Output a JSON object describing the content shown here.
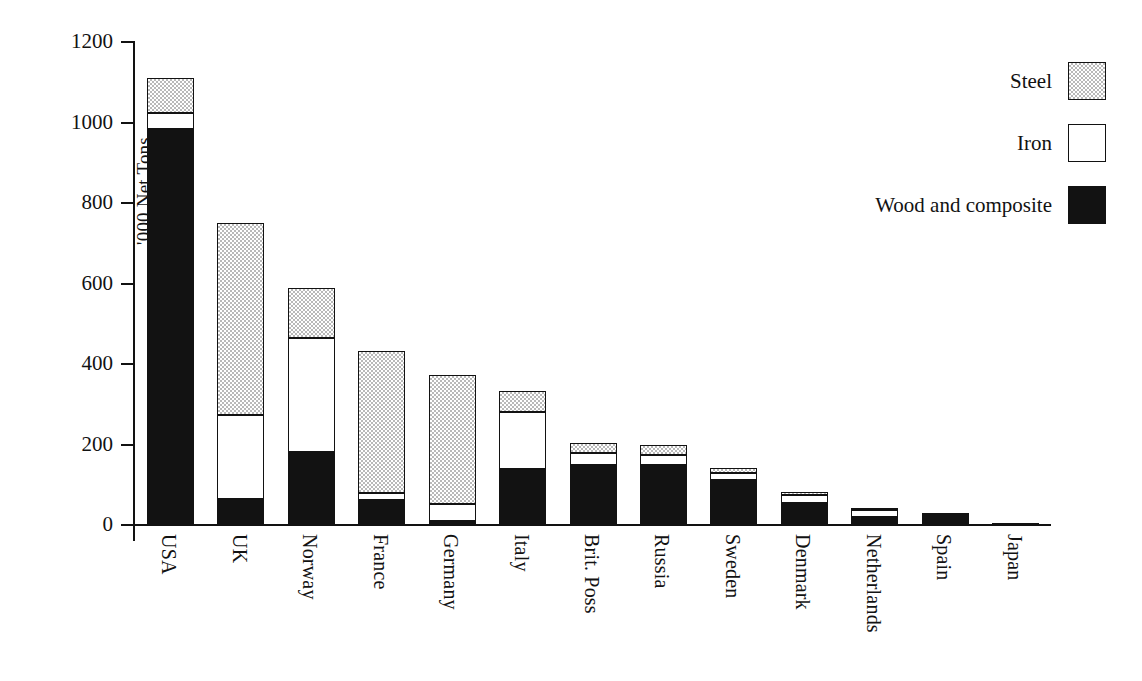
{
  "chart_data": {
    "type": "bar",
    "subtype": "stacked-bar",
    "title": "",
    "xlabel": "",
    "ylabel": "'000 Net Tons",
    "ylim": [
      0,
      1200
    ],
    "ytick_step": 200,
    "yticks": [
      0,
      200,
      400,
      600,
      800,
      1000,
      1200
    ],
    "ytick_labels": [
      "0",
      "200",
      "400",
      "600",
      "800",
      "1000",
      "1200"
    ],
    "grid": false,
    "legend_position": "top-right",
    "categories": [
      "USA",
      "UK",
      "Norway",
      "France",
      "Germany",
      "Italy",
      "Brit. Poss",
      "Russia",
      "Sweden",
      "Denmark",
      "Netherlands",
      "Spain",
      "Japan"
    ],
    "series": [
      {
        "name": "Wood and composite",
        "color": "#121212",
        "values": [
          985,
          65,
          181,
          62,
          10,
          140,
          150,
          148,
          112,
          55,
          20,
          30,
          5
        ]
      },
      {
        "name": "Iron",
        "color": "#ffffff",
        "values": [
          38,
          208,
          284,
          18,
          42,
          140,
          30,
          26,
          17,
          20,
          17,
          0,
          0
        ]
      },
      {
        "name": "Steel",
        "color": "#b9b9b9",
        "values": [
          88,
          478,
          124,
          353,
          320,
          53,
          25,
          24,
          13,
          8,
          6,
          0,
          0
        ]
      }
    ],
    "totals": [
      1111,
      751,
      589,
      433,
      372,
      333,
      205,
      198,
      142,
      83,
      43,
      30,
      5
    ]
  },
  "axis": {
    "y_label": "'000 Net Tons",
    "y_ticks": [
      "1200",
      "1000",
      "800",
      "600",
      "400",
      "200",
      "0"
    ]
  },
  "legend": {
    "items": [
      {
        "label": "Steel",
        "swatch": "steel-pattern-swatch"
      },
      {
        "label": "Iron",
        "swatch": "iron-white-swatch"
      },
      {
        "label": "Wood and composite",
        "swatch": "wood-black-swatch"
      }
    ]
  }
}
